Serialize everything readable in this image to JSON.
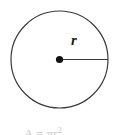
{
  "figure": {
    "name": "circle-radius-diagram",
    "background_color": "#ffffff",
    "stroke_color": "#3a3a3a",
    "center_dot_color": "#111111",
    "label_color": "#1a1a1a",
    "circle": {
      "center_x": 59.5,
      "center_y": 59.5,
      "radius": 48.5,
      "stroke_width": 1.2,
      "fill": "none"
    },
    "center_point": {
      "x": 59.5,
      "y": 59.5,
      "dot_radius": 3.6
    },
    "radius_segment": {
      "from_x": 59.5,
      "from_y": 59.5,
      "to_x": 108,
      "to_y": 59.5,
      "stroke_width": 1.2
    },
    "radius_label": "r"
  },
  "caption": {
    "visible_fragment": "A = πr",
    "exponent": "2",
    "note": "cropped at bottom edge, only glyph tops visible",
    "color": "#c9c9c9"
  }
}
